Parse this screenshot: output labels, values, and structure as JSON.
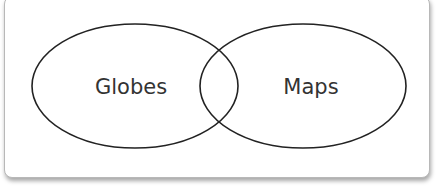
{
  "diagram": {
    "type": "venn",
    "sets": [
      {
        "label": "Globes",
        "cx": 135,
        "cy": 86,
        "rx": 103,
        "ry": 62
      },
      {
        "label": "Maps",
        "cx": 303,
        "cy": 86,
        "rx": 103,
        "ry": 62
      }
    ],
    "stroke_color": "#222222"
  }
}
